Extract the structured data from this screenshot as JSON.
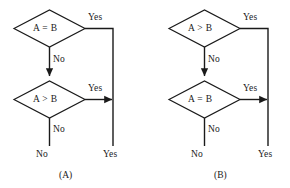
{
  "figure": {
    "background_color": "#ffffff",
    "stroke_color": "#1a1a1a",
    "text_color": "#1a1a1a"
  },
  "panels": [
    {
      "id": "A",
      "caption": "(A)",
      "decision_1": {
        "condition": "A = B",
        "yes_label": "Yes",
        "no_label": "No"
      },
      "decision_2": {
        "condition": "A > B",
        "yes_label": "Yes",
        "no_label": "No"
      },
      "terminal_no": "No",
      "terminal_yes": "Yes"
    },
    {
      "id": "B",
      "caption": "(B)",
      "decision_1": {
        "condition": "A > B",
        "yes_label": "Yes",
        "no_label": "No"
      },
      "decision_2": {
        "condition": "A = B",
        "yes_label": "Yes",
        "no_label": "No"
      },
      "terminal_no": "No",
      "terminal_yes": "Yes"
    }
  ]
}
